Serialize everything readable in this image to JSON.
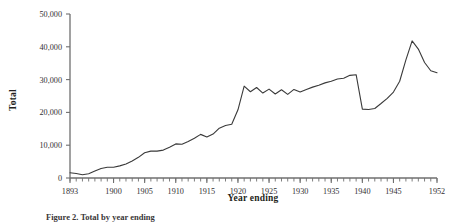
{
  "figure": {
    "axis_color": "#6f6f6f",
    "line_color": "#3a3a3a",
    "background": "#ffffff"
  },
  "labels": {
    "ylabel": "Total",
    "xlabel": "Year ending"
  },
  "caption": {
    "text": "Figure 2.   Total by year ending"
  },
  "chart_data": {
    "type": "line",
    "title": "",
    "xlabel": "Year ending",
    "ylabel": "Total",
    "xlim": [
      1893,
      1952
    ],
    "ylim": [
      0,
      50000
    ],
    "grid": false,
    "legend": "none",
    "ytick_labels": [
      "0",
      "10,000",
      "20,000",
      "30,000",
      "40,000",
      "50,000"
    ],
    "ytick_values": [
      0,
      10000,
      20000,
      30000,
      40000,
      50000
    ],
    "xtick_labels": [
      "1893",
      "1900",
      "1905",
      "1910",
      "1915",
      "1920",
      "1925",
      "1930",
      "1935",
      "1940",
      "1945",
      "1952"
    ],
    "xtick_values": [
      1893,
      1900,
      1905,
      1910,
      1915,
      1920,
      1925,
      1930,
      1935,
      1940,
      1945,
      1952
    ],
    "minor_tick_interval": 1,
    "x": [
      1893,
      1894,
      1895,
      1896,
      1897,
      1898,
      1899,
      1900,
      1901,
      1902,
      1903,
      1904,
      1905,
      1906,
      1907,
      1908,
      1909,
      1910,
      1911,
      1912,
      1913,
      1914,
      1915,
      1916,
      1917,
      1918,
      1919,
      1920,
      1921,
      1922,
      1923,
      1924,
      1925,
      1926,
      1927,
      1928,
      1929,
      1930,
      1931,
      1932,
      1933,
      1934,
      1935,
      1936,
      1937,
      1938,
      1939,
      1940,
      1941,
      1942,
      1943,
      1944,
      1945,
      1946,
      1947,
      1948,
      1949,
      1950,
      1951,
      1952
    ],
    "values": [
      1600,
      1350,
      1000,
      1300,
      2100,
      2900,
      3300,
      3300,
      3700,
      4300,
      5200,
      6300,
      7700,
      8200,
      8200,
      8500,
      9400,
      10400,
      10300,
      11100,
      12100,
      13300,
      12500,
      13400,
      15200,
      16000,
      16400,
      20800,
      28000,
      26300,
      27600,
      25900,
      27100,
      25600,
      26900,
      25500,
      27000,
      26200,
      27000,
      27700,
      28300,
      29000,
      29500,
      30200,
      30400,
      31300,
      31500,
      21000,
      20900,
      21200,
      22700,
      24300,
      26200,
      29500,
      36000,
      41800,
      39300,
      35200,
      32700,
      32100
    ],
    "series": [
      {
        "name": "Total",
        "values": [
          1600,
          1350,
          1000,
          1300,
          2100,
          2900,
          3300,
          3300,
          3700,
          4300,
          5200,
          6300,
          7700,
          8200,
          8200,
          8500,
          9400,
          10400,
          10300,
          11100,
          12100,
          13300,
          12500,
          13400,
          15200,
          16000,
          16400,
          20800,
          28000,
          26300,
          27600,
          25900,
          27100,
          25600,
          26900,
          25500,
          27000,
          26200,
          27000,
          27700,
          28300,
          29000,
          29500,
          30200,
          30400,
          31300,
          31500,
          21000,
          20900,
          21200,
          22700,
          24300,
          26200,
          29500,
          36000,
          41800,
          39300,
          35200,
          32700,
          32100
        ]
      }
    ],
    "annotations": [
      "Sharp rise 1919-1921 to about 28,000",
      "Oscillating plateau 1921-1931 between 25,500 and 28,000",
      "Abrupt drop 1939-1940 from 31,500 to 21,000",
      "Peak of about 41,800 in 1948",
      "Decline to about 32,100 by 1952"
    ]
  }
}
